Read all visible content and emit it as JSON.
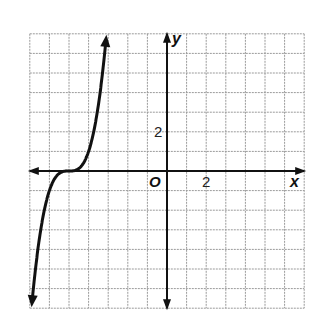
{
  "chart_data": {
    "type": "line",
    "title": "",
    "function": "y = (x + 5)^3",
    "xlabel": "x",
    "ylabel": "y",
    "origin_label": "O",
    "xlim": [
      -7,
      7
    ],
    "ylim": [
      -7,
      7
    ],
    "grid": true,
    "grid_step": 1,
    "tick_labels": {
      "x": [
        "2"
      ],
      "y": [
        "2"
      ]
    },
    "series": [
      {
        "name": "curve",
        "x": [
          -6.9,
          -6.5,
          -6,
          -5.5,
          -5,
          -4.5,
          -4,
          -3.5,
          -3.1
        ],
        "y": [
          -6.86,
          -3.38,
          -1,
          -0.13,
          0,
          0.13,
          1,
          3.38,
          6.86
        ]
      }
    ],
    "legend": null
  },
  "labels": {
    "x_axis": "x",
    "y_axis": "y",
    "origin": "O",
    "x_tick": "2",
    "y_tick": "2"
  }
}
